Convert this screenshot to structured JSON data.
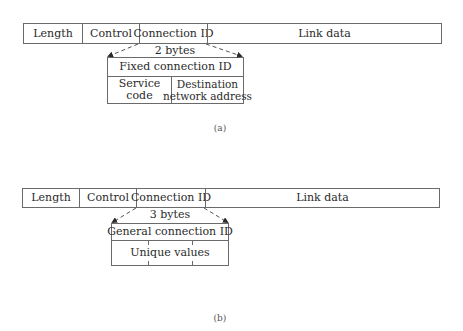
{
  "diagram_a": {
    "caption": "(a)",
    "frame_fields": [
      "Length",
      "Control",
      "Connection ID",
      "Link data"
    ],
    "size_label": "2 bytes",
    "sub_header": "Fixed connection ID",
    "sub_fields": [
      {
        "line1": "Service",
        "line2": "code"
      },
      {
        "line1": "Destination",
        "line2": "network address"
      }
    ]
  },
  "diagram_b": {
    "caption": "(b)",
    "frame_fields": [
      "Length",
      "Control",
      "Connection ID",
      "Link data"
    ],
    "size_label": "3 bytes",
    "sub_header": "General connection ID",
    "sub_body": "Unique values"
  },
  "colors": {
    "line": "#6a6a6a",
    "text": "#2a2a2a",
    "background": "#ffffff"
  }
}
